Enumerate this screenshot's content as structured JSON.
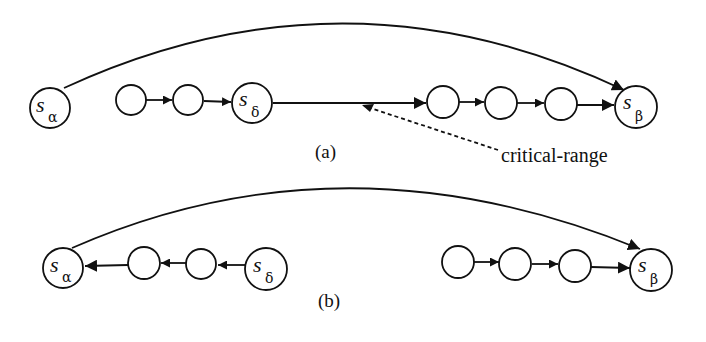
{
  "diagram_a": {
    "caption": "(a)",
    "nodes": [
      {
        "id": "s_alpha",
        "label": "s",
        "sub": "α"
      },
      {
        "id": "n1",
        "label": ""
      },
      {
        "id": "n2",
        "label": ""
      },
      {
        "id": "s_delta",
        "label": "s",
        "sub": "δ"
      },
      {
        "id": "n3",
        "label": ""
      },
      {
        "id": "n4",
        "label": ""
      },
      {
        "id": "n5",
        "label": ""
      },
      {
        "id": "s_beta",
        "label": "s",
        "sub": "β"
      }
    ],
    "edges": [
      {
        "from": "s_alpha",
        "to": "s_beta",
        "type": "arc"
      },
      {
        "from": "n1",
        "to": "n2"
      },
      {
        "from": "n2",
        "to": "s_delta"
      },
      {
        "from": "s_delta",
        "to": "n3"
      },
      {
        "from": "n3",
        "to": "n4"
      },
      {
        "from": "n4",
        "to": "n5"
      },
      {
        "from": "n5",
        "to": "s_beta"
      }
    ],
    "annotation": "critical-range"
  },
  "diagram_b": {
    "caption": "(b)",
    "nodes": [
      {
        "id": "s_alpha",
        "label": "s",
        "sub": "α"
      },
      {
        "id": "n1",
        "label": ""
      },
      {
        "id": "n2",
        "label": ""
      },
      {
        "id": "s_delta",
        "label": "s",
        "sub": "δ"
      },
      {
        "id": "n3",
        "label": ""
      },
      {
        "id": "n4",
        "label": ""
      },
      {
        "id": "n5",
        "label": ""
      },
      {
        "id": "s_beta",
        "label": "s",
        "sub": "β"
      }
    ],
    "edges": [
      {
        "from": "s_alpha",
        "to": "s_beta",
        "type": "arc"
      },
      {
        "from": "s_delta",
        "to": "n2"
      },
      {
        "from": "n2",
        "to": "n1"
      },
      {
        "from": "n1",
        "to": "s_alpha"
      },
      {
        "from": "n3",
        "to": "n4"
      },
      {
        "from": "n4",
        "to": "n5"
      },
      {
        "from": "n5",
        "to": "s_beta"
      }
    ]
  }
}
